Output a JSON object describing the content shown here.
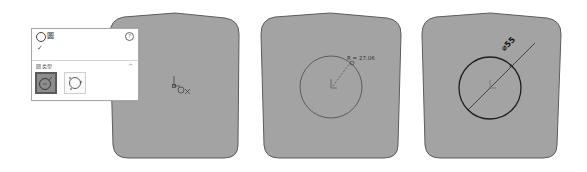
{
  "panel": {
    "title": "圆",
    "help_icon": "?",
    "ok_icon": "✓",
    "section_label": "圆类型",
    "collapse_icon": "^",
    "circle_types": [
      {
        "name": "center-circle",
        "selected": true
      },
      {
        "name": "perimeter-circle",
        "selected": false
      }
    ]
  },
  "views": [
    {
      "step": 1,
      "description": "cursor placing circle center at origin"
    },
    {
      "step": 2,
      "description": "dragging circle radius",
      "radius_label": "R = 27.06"
    },
    {
      "step": 3,
      "description": "circle with diameter dimension",
      "diameter_label": "⌀55"
    }
  ],
  "colors": {
    "sketch_fill": "#a3a3a3",
    "sketch_outline": "#5c5c5c",
    "circle_stroke": "#3a3a3a",
    "panel_bg": "#ffffff",
    "selected_btn_bg": "#8c8c8c"
  }
}
